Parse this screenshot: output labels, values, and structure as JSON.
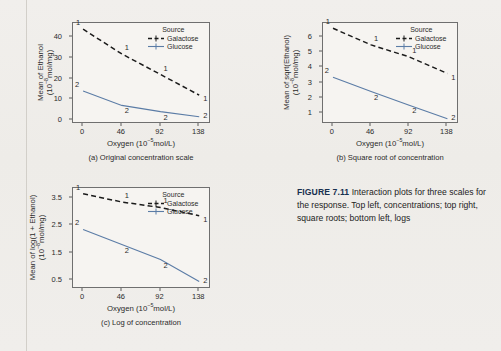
{
  "figure": {
    "label": "FIGURE 7.11",
    "caption": "Interaction plots for three scales for the response. Top left, concentrations; top right, square roots; bottom left, logs"
  },
  "legend": {
    "title": "Source",
    "entries": [
      {
        "label": "Galactose",
        "marker": "1",
        "color": "#1a1a1a",
        "style": "dashed"
      },
      {
        "label": "Glucose",
        "marker": "2",
        "color": "#5b7ca6",
        "style": "solid"
      }
    ]
  },
  "chart_data": [
    {
      "id": "a",
      "type": "line",
      "title": "(a) Original concentration scale",
      "xlabel": "Oxygen (10−5mol/L)",
      "ylabel": "Mean of Ethanol",
      "ylabel2": "(10−8mol/mg)",
      "categories": [
        "0",
        "46",
        "92",
        "138"
      ],
      "x": [
        0,
        46,
        92,
        138
      ],
      "xlim": [
        -12,
        152
      ],
      "yticks": [
        "0",
        "10",
        "20",
        "30",
        "40"
      ],
      "ytickvals": [
        0,
        10,
        20,
        30,
        40
      ],
      "ylim": [
        -2,
        47
      ],
      "grid": false,
      "legend_position": "top-right",
      "series": [
        {
          "name": "Galactose",
          "marker": "1",
          "color": "#1a1a1a",
          "style": "dashed",
          "values": [
            44,
            32,
            22,
            12
          ]
        },
        {
          "name": "Glucose",
          "marker": "2",
          "color": "#5b7ca6",
          "style": "solid",
          "values": [
            14,
            7,
            4,
            1.5
          ]
        }
      ]
    },
    {
      "id": "b",
      "type": "line",
      "title": "(b) Square root of concentration",
      "xlabel": "Oxygen (10−5mol/L)",
      "ylabel": "Mean of sqrt(Ethanol)",
      "ylabel2": "(10−8mol/mg)",
      "categories": [
        "0",
        "46",
        "92",
        "138"
      ],
      "x": [
        0,
        46,
        92,
        138
      ],
      "xlim": [
        -12,
        152
      ],
      "yticks": [
        "1",
        "2",
        "3",
        "4",
        "5",
        "6"
      ],
      "ytickvals": [
        1,
        2,
        3,
        4,
        5,
        6
      ],
      "ylim": [
        0.25,
        6.95
      ],
      "grid": false,
      "legend_position": "top-right",
      "series": [
        {
          "name": "Galactose",
          "marker": "1",
          "color": "#1a1a1a",
          "style": "dashed",
          "values": [
            6.6,
            5.5,
            4.7,
            3.6
          ]
        },
        {
          "name": "Glucose",
          "marker": "2",
          "color": "#5b7ca6",
          "style": "solid",
          "values": [
            3.35,
            2.4,
            1.5,
            0.6
          ]
        }
      ]
    },
    {
      "id": "c",
      "type": "line",
      "title": "(c) Log of concentration",
      "xlabel": "Oxygen (10−5mol/L)",
      "ylabel": "Mean of log(1 + Ethanol)",
      "ylabel2": "(10−8mol/mg)",
      "categories": [
        "0",
        "46",
        "92",
        "138"
      ],
      "x": [
        0,
        46,
        92,
        138
      ],
      "xlim": [
        -12,
        152
      ],
      "yticks": [
        "0.5",
        "1.5",
        "2.5",
        "3.5"
      ],
      "ytickvals": [
        0.5,
        1.5,
        2.5,
        3.5
      ],
      "ylim": [
        0.18,
        3.86
      ],
      "grid": false,
      "legend_position": "top-right",
      "series": [
        {
          "name": "Galactose",
          "marker": "1",
          "color": "#1a1a1a",
          "style": "dashed",
          "values": [
            3.65,
            3.35,
            3.15,
            2.85
          ]
        },
        {
          "name": "Glucose",
          "marker": "2",
          "color": "#5b7ca6",
          "style": "solid",
          "values": [
            2.35,
            1.8,
            1.25,
            0.45
          ]
        }
      ]
    }
  ]
}
